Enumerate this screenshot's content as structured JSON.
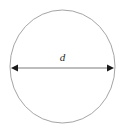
{
  "figure": {
    "background_color": "#ffffff",
    "width": 126,
    "height": 131
  },
  "chart_data": {
    "type": "diagram",
    "title": "",
    "subtitle": "",
    "xlabel": "",
    "ylabel": "",
    "shapes": [
      {
        "name": "circle",
        "kind": "ellipse",
        "center_x": 62.5,
        "center_y": 66.5,
        "radius_x": 52.5,
        "radius_y": 56.5,
        "stroke_color": "#9a9a9a",
        "stroke_width": 0.9,
        "fill": "none"
      },
      {
        "name": "diameter-arrow",
        "kind": "double-headed-arrow",
        "x1": 11,
        "y1": 68,
        "x2": 114,
        "y2": 68,
        "stroke_color": "#7d7d7d",
        "stroke_width": 1.1,
        "arrowhead_color": "#1a1a1a",
        "arrowhead_length": 7,
        "arrowhead_half_width": 3.4
      }
    ],
    "annotations": [
      {
        "name": "diameter-label",
        "text": "d",
        "x": 62.5,
        "y": 61,
        "style": "italic-serif",
        "color": "#2b2b2b",
        "font_size": 11
      }
    ],
    "legend": null,
    "grid": false
  }
}
